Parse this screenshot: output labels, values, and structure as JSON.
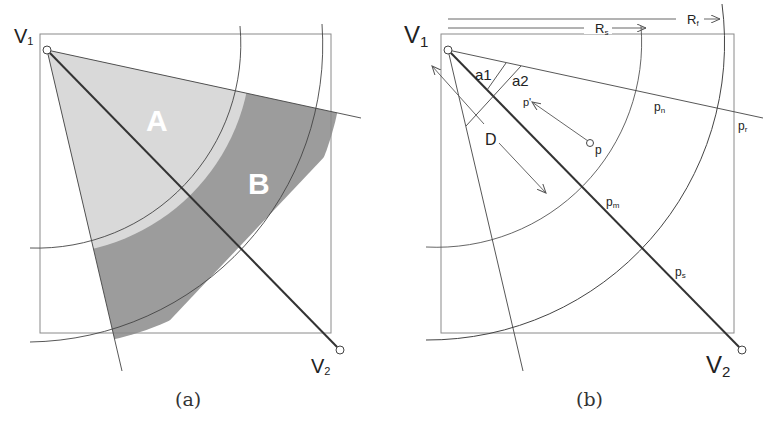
{
  "panel_a": {
    "caption": "(a)",
    "vertex1": "V",
    "vertex1_sub": "1",
    "vertex2": "V",
    "vertex2_sub": "2",
    "region_a": "A",
    "region_b": "B",
    "colors": {
      "region_a": "#d8d8d8",
      "region_b": "#9a9a9a",
      "stroke": "#333333",
      "box": "#888888"
    }
  },
  "panel_b": {
    "caption": "(b)",
    "vertex1": "V",
    "vertex1_sub": "1",
    "vertex2": "V",
    "vertex2_sub": "2",
    "angle1": "a1",
    "angle2": "a2",
    "distance": "D",
    "radius_s": "R",
    "radius_s_sub": "s",
    "radius_f": "R",
    "radius_f_sub": "f",
    "point_p": "p",
    "point_p_prime": "p'",
    "point_n": "p",
    "point_n_sub": "n",
    "point_r": "p",
    "point_r_sub": "r",
    "point_m": "p",
    "point_m_sub": "m",
    "point_s": "p",
    "point_s_sub": "s"
  }
}
